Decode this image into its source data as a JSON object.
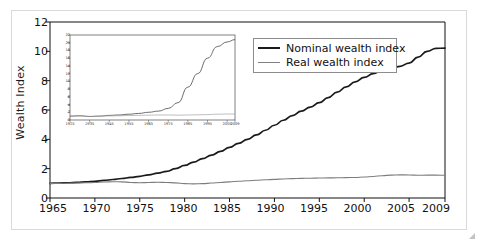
{
  "chart_data": {
    "type": "line",
    "title": "",
    "xlabel": "",
    "ylabel": "Wealth Index",
    "xlim": [
      1965,
      2009
    ],
    "ylim": [
      0,
      12
    ],
    "grid": false,
    "legend_position": "top-right",
    "x_ticklabels": [
      "1965",
      "1970",
      "1975",
      "1980",
      "1985",
      "1990",
      "1995",
      "2000",
      "2005",
      "2009"
    ],
    "x_tickvalues": [
      1965,
      1970,
      1975,
      1980,
      1985,
      1990,
      1995,
      2000,
      2005,
      2009
    ],
    "y_ticklabels": [
      "0",
      "2",
      "4",
      "6",
      "8",
      "10",
      "12"
    ],
    "y_tickvalues": [
      0,
      2,
      4,
      6,
      8,
      10,
      12
    ],
    "x": [
      1965,
      1966,
      1967,
      1968,
      1969,
      1970,
      1971,
      1972,
      1973,
      1974,
      1975,
      1976,
      1977,
      1978,
      1979,
      1980,
      1981,
      1982,
      1983,
      1984,
      1985,
      1986,
      1987,
      1988,
      1989,
      1990,
      1991,
      1992,
      1993,
      1994,
      1995,
      1996,
      1997,
      1998,
      1999,
      2000,
      2001,
      2002,
      2003,
      2004,
      2005,
      2006,
      2007,
      2008,
      2009
    ],
    "series": [
      {
        "name": "Nominal wealth index",
        "color": "#1a1a1a",
        "values": [
          1.0,
          1.02,
          1.04,
          1.07,
          1.1,
          1.14,
          1.2,
          1.26,
          1.33,
          1.4,
          1.48,
          1.58,
          1.7,
          1.82,
          2.0,
          2.22,
          2.45,
          2.68,
          2.92,
          3.18,
          3.45,
          3.72,
          4.0,
          4.3,
          4.62,
          4.96,
          5.3,
          5.62,
          5.92,
          6.2,
          6.5,
          6.85,
          7.22,
          7.58,
          7.92,
          8.22,
          8.48,
          8.7,
          8.82,
          8.98,
          9.2,
          9.6,
          10.0,
          10.2,
          10.22
        ]
      },
      {
        "name": "Real wealth index",
        "color": "#7d7d7d",
        "values": [
          1.0,
          1.0,
          1.01,
          1.02,
          1.04,
          1.06,
          1.09,
          1.11,
          1.1,
          1.06,
          1.04,
          1.06,
          1.07,
          1.06,
          1.03,
          0.98,
          0.96,
          0.98,
          1.02,
          1.06,
          1.1,
          1.14,
          1.18,
          1.21,
          1.24,
          1.27,
          1.3,
          1.32,
          1.34,
          1.35,
          1.36,
          1.37,
          1.38,
          1.39,
          1.4,
          1.43,
          1.47,
          1.52,
          1.56,
          1.58,
          1.57,
          1.55,
          1.56,
          1.56,
          1.55
        ]
      }
    ],
    "inset": {
      "type": "line",
      "xlim": [
        1925,
        2009
      ],
      "ylim": [
        0,
        22
      ],
      "x_ticklabels": [
        "1925",
        "1935",
        "1945",
        "1955",
        "1965",
        "1975",
        "1985",
        "1995",
        "2005",
        "2009"
      ],
      "x_tickvalues": [
        1925,
        1935,
        1945,
        1955,
        1965,
        1975,
        1985,
        1995,
        2005,
        2009
      ],
      "y_ticklabels": [
        "0",
        "2",
        "4",
        "6",
        "8",
        "10",
        "12",
        "14",
        "16",
        "18",
        "20",
        "22"
      ],
      "y_tickvalues": [
        0,
        2,
        4,
        6,
        8,
        10,
        12,
        14,
        16,
        18,
        20,
        22
      ],
      "x": [
        1925,
        1930,
        1935,
        1940,
        1945,
        1950,
        1955,
        1960,
        1965,
        1970,
        1975,
        1980,
        1985,
        1990,
        1995,
        2000,
        2005,
        2009
      ],
      "series": [
        {
          "name": "Nominal wealth index",
          "color": "#4a4a4a",
          "values": [
            1.0,
            1.1,
            0.9,
            1.0,
            1.2,
            1.3,
            1.5,
            1.7,
            2.0,
            2.3,
            3.0,
            4.5,
            8.5,
            12.0,
            16.0,
            19.0,
            20.2,
            20.8
          ]
        },
        {
          "name": "Real wealth index",
          "color": "#a0a0a0",
          "values": [
            1.0,
            1.05,
            0.95,
            1.0,
            1.05,
            1.1,
            1.15,
            1.2,
            1.25,
            1.3,
            1.3,
            1.25,
            1.3,
            1.35,
            1.4,
            1.5,
            1.55,
            1.55
          ]
        }
      ]
    }
  },
  "legend": {
    "items": [
      {
        "label": "Nominal wealth index",
        "style": "thick-dark"
      },
      {
        "label": "Real wealth index",
        "style": "thin-gray"
      }
    ]
  },
  "axes": {
    "y_title": "Wealth Index"
  }
}
